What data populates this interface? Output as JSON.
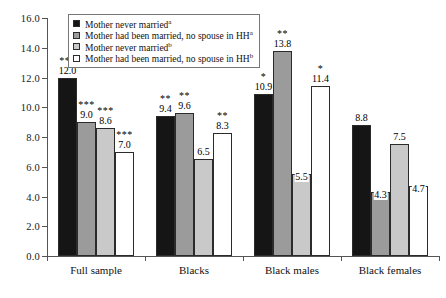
{
  "chart_data": {
    "type": "bar",
    "title": "",
    "xlabel": "",
    "ylabel": "",
    "ylim": [
      0.0,
      16.0
    ],
    "ytick_step": 2.0,
    "ytick_labels": [
      "0.0",
      "2.0",
      "4.0",
      "6.0",
      "8.0",
      "10.0",
      "12.0",
      "14.0",
      "16.0"
    ],
    "grid": false,
    "legend_position": "top-left-inside",
    "categories": [
      "Full sample",
      "Blacks",
      "Black males",
      "Black females"
    ],
    "series": [
      {
        "name": "Mother never married",
        "superscript": "a",
        "fill": "#151515",
        "values": [
          12.0,
          9.4,
          10.9,
          8.8
        ],
        "value_labels": [
          "12.0",
          "9.4",
          "10.9",
          "8.8"
        ],
        "significance": [
          "***",
          "**",
          "*",
          ""
        ]
      },
      {
        "name": "Mother had been married, no spouse in HH",
        "superscript": "a",
        "fill": "#9b9b9b",
        "values": [
          9.0,
          9.6,
          13.8,
          4.3
        ],
        "value_labels": [
          "9.0",
          "9.6",
          "13.8",
          "4.3"
        ],
        "significance": [
          "***",
          "**",
          "**",
          ""
        ]
      },
      {
        "name": "Mother never married",
        "superscript": "b",
        "fill": "#c9c9c9",
        "values": [
          8.6,
          6.5,
          5.5,
          7.5
        ],
        "value_labels": [
          "8.6",
          "6.5",
          "5.5",
          "7.5"
        ],
        "significance": [
          "***",
          "",
          "",
          ""
        ]
      },
      {
        "name": "Mother had been married, no spouse in HH",
        "superscript": "b",
        "fill": "#ffffff",
        "values": [
          7.0,
          8.3,
          11.4,
          4.7
        ],
        "value_labels": [
          "7.0",
          "8.3",
          "11.4",
          "4.7"
        ],
        "significance": [
          "***",
          "**",
          "*",
          ""
        ]
      }
    ]
  },
  "legend": {
    "items": [
      {
        "label": "Mother never married",
        "superscript": "a"
      },
      {
        "label": "Mother had been married, no spouse in HH",
        "superscript": "a"
      },
      {
        "label": "Mother never married",
        "superscript": "b"
      },
      {
        "label": "Mother had been married, no spouse in HH",
        "superscript": "b"
      }
    ]
  }
}
